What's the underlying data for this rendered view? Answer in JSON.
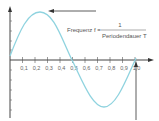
{
  "diagram": {
    "formula": {
      "lhs": "Frequenz f =",
      "numerator": "1",
      "denominator": "Periodendauer T"
    },
    "x_tick_labels": [
      "0,1",
      "0,2",
      "0,3",
      "0,4",
      "0,5",
      "0,6",
      "0,7",
      "0,8",
      "0,9",
      "1,0"
    ],
    "colors": {
      "curve": "#8fd3df",
      "axis": "#444444",
      "arrow": "#333333"
    }
  },
  "chart_data": {
    "type": "line",
    "title": "",
    "xlabel": "",
    "ylabel": "",
    "x": [
      0,
      0.125,
      0.25,
      0.375,
      0.5,
      0.625,
      0.75,
      0.875,
      1.0
    ],
    "series": [
      {
        "name": "sine",
        "values": [
          0,
          0.707,
          1,
          0.707,
          0,
          -0.707,
          -1,
          -0.707,
          0
        ]
      }
    ],
    "x_ticks": [
      "0,1",
      "0,2",
      "0,3",
      "0,4",
      "0,5",
      "0,6",
      "0,7",
      "0,8",
      "0,9",
      "1,0"
    ],
    "xlim": [
      0,
      1.05
    ],
    "ylim": [
      -1.1,
      1.1
    ],
    "grid": false
  }
}
